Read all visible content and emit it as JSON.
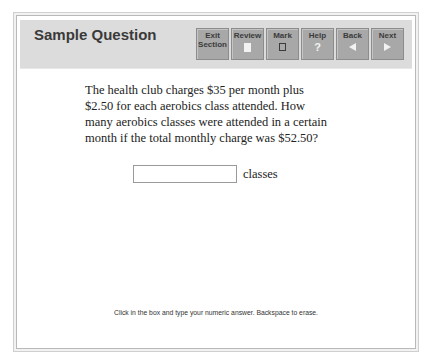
{
  "header": {
    "title": "Sample Question"
  },
  "toolbar": {
    "buttons": [
      {
        "label_line1": "Exit",
        "label_line2": "Section",
        "icon": "none"
      },
      {
        "label": "Review",
        "icon": "review-page-icon"
      },
      {
        "label": "Mark",
        "icon": "checkbox-icon"
      },
      {
        "label": "Help",
        "icon": "question-mark-icon",
        "glyph": "?"
      },
      {
        "label": "Back",
        "icon": "arrow-left-icon"
      },
      {
        "label": "Next",
        "icon": "arrow-right-icon"
      }
    ]
  },
  "question": {
    "text": "The health club charges $35 per month plus $2.50 for each aerobics class attended. How many aerobics classes were attended in a certain month if the total monthly charge was $52.50?"
  },
  "answer": {
    "value": "",
    "placeholder": "",
    "unit_label": "classes"
  },
  "footer": {
    "instructions": "Click in the box and type your numeric answer. Backspace to erase."
  },
  "colors": {
    "header_bg": "#dcdcdc",
    "button_bg": "#a8a8a8",
    "button_text": "#3b3b3b"
  }
}
